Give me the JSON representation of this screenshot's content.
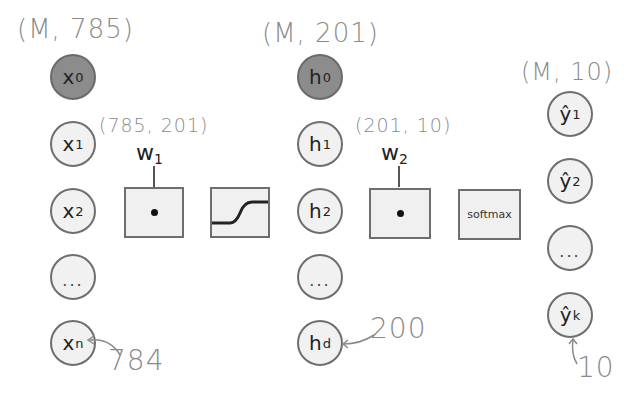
{
  "input_layer": {
    "shape_label": "(M, 785)",
    "nodes": [
      {
        "label": "x",
        "sub": "0",
        "bias": true
      },
      {
        "label": "x",
        "sub": "1"
      },
      {
        "label": "x",
        "sub": "2"
      },
      {
        "label": "..."
      },
      {
        "label": "x",
        "sub": "n"
      }
    ],
    "annotation": "784"
  },
  "weights_1": {
    "shape_label": "(785, 201)",
    "label": "w",
    "sub": "1",
    "operation": "dot-product",
    "symbol": "•"
  },
  "activation": {
    "name": "sigmoid"
  },
  "hidden_layer": {
    "shape_label": "(M, 201)",
    "nodes": [
      {
        "label": "h",
        "sub": "0",
        "bias": true
      },
      {
        "label": "h",
        "sub": "1"
      },
      {
        "label": "h",
        "sub": "2"
      },
      {
        "label": "..."
      },
      {
        "label": "h",
        "sub": "d"
      }
    ],
    "annotation": "200"
  },
  "weights_2": {
    "shape_label": "(201, 10)",
    "label": "w",
    "sub": "2",
    "operation": "dot-product",
    "symbol": "•"
  },
  "output_activation": {
    "label": "softmax"
  },
  "output_layer": {
    "shape_label": "(M, 10)",
    "nodes": [
      {
        "label": "ŷ",
        "sub": "1"
      },
      {
        "label": "ŷ",
        "sub": "2"
      },
      {
        "label": "..."
      },
      {
        "label": "ŷ",
        "sub": "k"
      }
    ],
    "annotation": "10"
  },
  "colors": {
    "bias_fill": "#8c8c8c",
    "node_fill": "#f1f1f1",
    "stroke": "#6e6e6e",
    "handwriting": "#8a8a8a"
  }
}
